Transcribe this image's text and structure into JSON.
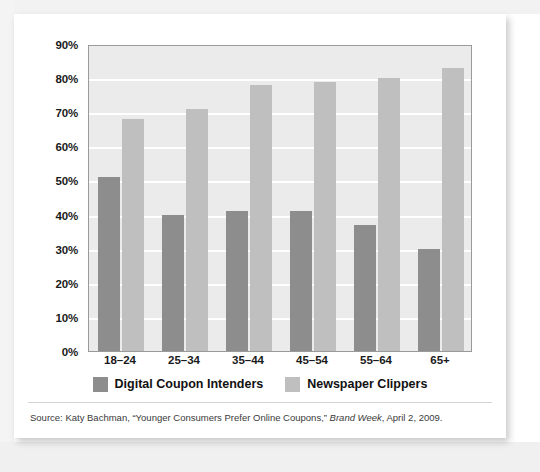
{
  "chart_data": {
    "type": "bar",
    "title": "",
    "xlabel": "",
    "ylabel": "",
    "categories": [
      "18–24",
      "25–34",
      "35–44",
      "45–54",
      "55–64",
      "65+"
    ],
    "series": [
      {
        "name": "Digital Coupon Intenders",
        "color": "#8d8d8d",
        "values": [
          51,
          40,
          41,
          41,
          37,
          30
        ]
      },
      {
        "name": "Newspaper Clippers",
        "color": "#bfbfbf",
        "values": [
          68,
          71,
          78,
          79,
          80,
          83
        ]
      }
    ],
    "ylim": [
      0,
      90
    ],
    "ytick_values": [
      0,
      10,
      20,
      30,
      40,
      50,
      60,
      70,
      80,
      90
    ],
    "ytick_labels": [
      "0%",
      "10%",
      "20%",
      "30%",
      "40%",
      "50%",
      "60%",
      "70%",
      "80%",
      "90%"
    ],
    "grid": true,
    "grid_color": "#ffffff",
    "plot_background": "#ebebeb",
    "legend_position": "bottom"
  },
  "legend": {
    "items": [
      {
        "label": "Digital Coupon Intenders",
        "color": "#8d8d8d"
      },
      {
        "label": "Newspaper Clippers",
        "color": "#bfbfbf"
      }
    ]
  },
  "source": {
    "prefix": "Source: Katy Bachman, “Younger Consumers Prefer Online Coupons,” ",
    "publication": "Brand Week",
    "suffix": ", April 2, 2009."
  }
}
